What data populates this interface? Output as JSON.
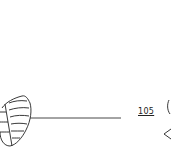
{
  "figure": {
    "type": "patent-line-drawing",
    "reference_numerals": [
      {
        "label": "105",
        "underlined": true
      }
    ],
    "elements": [
      {
        "name": "leaf-shape",
        "position": "left"
      },
      {
        "name": "leader-line",
        "from": "leaf-shape",
        "to": "blank"
      },
      {
        "name": "partial-shape",
        "position": "right-edge"
      }
    ],
    "colors": {
      "line": "#222222",
      "background": "#ffffff"
    }
  }
}
